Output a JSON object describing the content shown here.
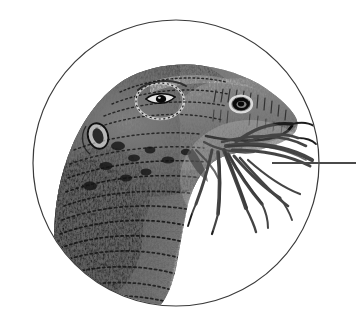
{
  "figure": {
    "kind": "scientific-engraving-illustration",
    "subject": "lizard head in profile feeding on plant stems",
    "subject_common_name": "lizard",
    "orientation": "facing right",
    "background_color": "#ffffff",
    "ink_color": "#2b2b2b",
    "canvas": {
      "width": 363,
      "height": 328
    },
    "frame": {
      "shape": "circle",
      "center_x": 176,
      "center_y": 163,
      "radius": 143,
      "stroke_color": "#3a3a3a",
      "stroke_width": 1.2,
      "fill": "none"
    },
    "leader_line": {
      "shape": "horizontal-line",
      "x_start": 272,
      "x_end": 356,
      "y": 163,
      "stroke_color": "#4a4a4a",
      "stroke_width": 2
    },
    "anatomy_labels": [
      {
        "name": "eye",
        "x": 160,
        "y": 101
      },
      {
        "name": "nostril",
        "x": 241,
        "y": 105
      },
      {
        "name": "ear-tympanum",
        "x": 98,
        "y": 136
      },
      {
        "name": "snout",
        "x": 258,
        "y": 118
      },
      {
        "name": "jaw",
        "x": 225,
        "y": 146
      },
      {
        "name": "neck",
        "x": 120,
        "y": 240
      }
    ],
    "plant_stems_count": 7,
    "tone_range": {
      "lightest": "#ffffff",
      "darkest": "#101010"
    }
  }
}
